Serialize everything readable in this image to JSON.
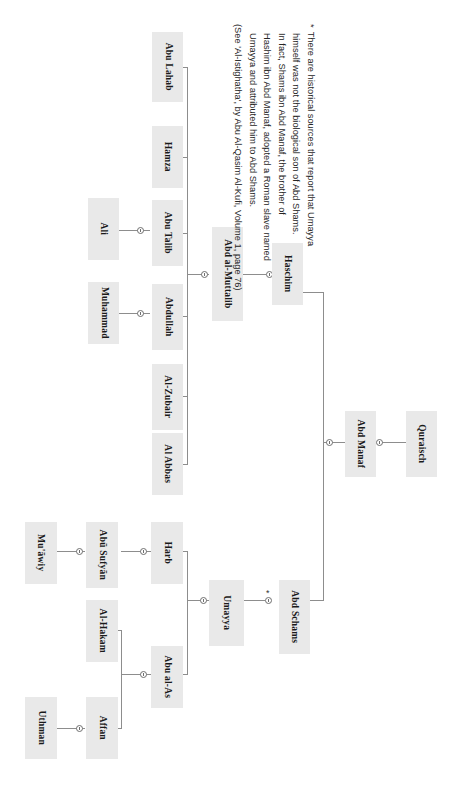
{
  "diagram": {
    "type": "genealogy-tree",
    "title_visible": false,
    "orientation": "rotated-90",
    "box_fill": "#e9e9e9",
    "line_color": "#8d8d8d",
    "nodes": [
      {
        "id": "abu-lahab",
        "label": "Abu Lahab"
      },
      {
        "id": "hamza",
        "label": "Hamza"
      },
      {
        "id": "abu-talib",
        "label": "Abu Talib"
      },
      {
        "id": "abdullah",
        "label": "Abdullah"
      },
      {
        "id": "al-zubair",
        "label": "Al-Zubair"
      },
      {
        "id": "al-abbas",
        "label": "Al Abbas"
      },
      {
        "id": "ali",
        "label": "Ali"
      },
      {
        "id": "muhammad",
        "label": "Muhammad"
      },
      {
        "id": "abd-al-muttalib",
        "label": "Abd al-Muttalib"
      },
      {
        "id": "haschim",
        "label": "Haschim"
      },
      {
        "id": "abd-manaf",
        "label": "Abd Manaf"
      },
      {
        "id": "quraisch",
        "label": "Quraisch"
      },
      {
        "id": "abd-schams",
        "label": "Abd Schams"
      },
      {
        "id": "umayya",
        "label": "Umayya"
      },
      {
        "id": "harb",
        "label": "Harb"
      },
      {
        "id": "abu-al-as",
        "label": "Abu al-As"
      },
      {
        "id": "abu-sufyan",
        "label": "Abū Sufyān"
      },
      {
        "id": "muawiy",
        "label": "Mu'āwiy"
      },
      {
        "id": "al-hakam",
        "label": "Al-Hakam"
      },
      {
        "id": "affan",
        "label": "Affan"
      },
      {
        "id": "uthman",
        "label": "Uthman"
      }
    ],
    "edges": [
      {
        "from": "quraisch",
        "to": "abd-manaf"
      },
      {
        "from": "abd-manaf",
        "to": "haschim"
      },
      {
        "from": "abd-manaf",
        "to": "abd-schams"
      },
      {
        "from": "abd-schams",
        "to": "umayya",
        "marker": "*"
      },
      {
        "from": "haschim",
        "to": "abd-al-muttalib"
      },
      {
        "from": "abd-al-muttalib",
        "to": "abu-lahab"
      },
      {
        "from": "abd-al-muttalib",
        "to": "hamza"
      },
      {
        "from": "abd-al-muttalib",
        "to": "abu-talib"
      },
      {
        "from": "abd-al-muttalib",
        "to": "abdullah"
      },
      {
        "from": "abd-al-muttalib",
        "to": "al-zubair"
      },
      {
        "from": "abd-al-muttalib",
        "to": "al-abbas"
      },
      {
        "from": "abu-talib",
        "to": "ali"
      },
      {
        "from": "abdullah",
        "to": "muhammad"
      },
      {
        "from": "umayya",
        "to": "harb"
      },
      {
        "from": "umayya",
        "to": "abu-al-as"
      },
      {
        "from": "harb",
        "to": "abu-sufyan"
      },
      {
        "from": "abu-sufyan",
        "to": "muawiy"
      },
      {
        "from": "abu-al-as",
        "to": "al-hakam"
      },
      {
        "from": "abu-al-as",
        "to": "affan"
      },
      {
        "from": "affan",
        "to": "uthman"
      }
    ]
  },
  "footnote": {
    "marker": "*",
    "lines": [
      "There are historical sources that report that Umayya",
      "himself was not the biological son of Abd Shams.",
      "In fact, Shams ibn Abd Manaf, the brother of",
      "Hashim ibn Abd Manaf, adopted a Roman slave named",
      "Umayya and attributed him to Abd Shams.",
      "(See 'Al-Istighatha', by Abu Al-Qasim Al-Kufi, Volume 1, page 76)"
    ]
  }
}
